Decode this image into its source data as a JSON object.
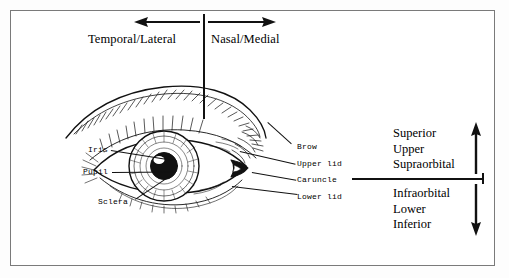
{
  "figure": {
    "type": "anatomical-diagram",
    "orientation": {
      "horizontal": {
        "left_label": "Temporal/Lateral",
        "right_label": "Nasal/Medial",
        "left_arrow": "arrow-left-icon",
        "right_arrow": "arrow-right-icon",
        "divider": "vertical-midline"
      },
      "vertical": {
        "upper_terms": [
          "Superior",
          "Upper",
          "Supraorbital"
        ],
        "lower_terms": [
          "Infraorbital",
          "Lower",
          "Inferior"
        ],
        "up_arrow": "arrow-up-icon",
        "down_arrow": "arrow-down-icon",
        "divider": "horizontal-midline"
      }
    },
    "labels_left": [
      {
        "text": "Iris"
      },
      {
        "text": "Pupil"
      },
      {
        "text": "Sclera"
      }
    ],
    "labels_right": [
      {
        "text": "Brow"
      },
      {
        "text": "Upper lid"
      },
      {
        "text": "Caruncle"
      },
      {
        "text": "Lower lid"
      }
    ],
    "colors": {
      "ink": "#111111",
      "frame": "#7a7a7a",
      "paper": "#ffffff"
    }
  }
}
